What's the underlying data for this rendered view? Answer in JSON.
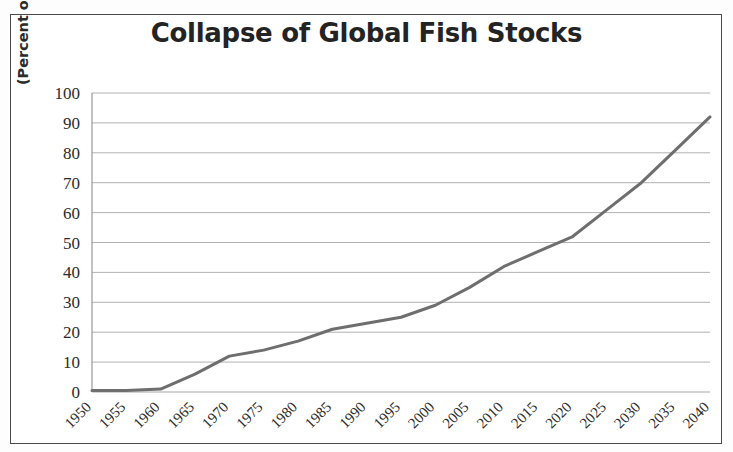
{
  "figure": {
    "title": "Collapse of Global Fish Stocks",
    "ylabel": "(Percent of Species Collapsed)",
    "border_color": "#4a4a4a",
    "background": "#ffffff"
  },
  "chart_data": {
    "type": "line",
    "title": "Collapse of Global Fish Stocks",
    "xlabel": "",
    "ylabel": "(Percent of Species Collapsed)",
    "categories": [
      "1950",
      "1955",
      "1960",
      "1965",
      "1970",
      "1975",
      "1980",
      "1985",
      "1990",
      "1995",
      "2000",
      "2005",
      "2010",
      "2015",
      "2020",
      "2025",
      "2030",
      "2035",
      "2040"
    ],
    "values": [
      0.5,
      0.5,
      1,
      6,
      12,
      14,
      17,
      21,
      23,
      25,
      29,
      35,
      42,
      47,
      52,
      61,
      70,
      81,
      92
    ],
    "series": [
      {
        "name": "Percent of Species Collapsed",
        "color": "#6e6e6e",
        "values": [
          0.5,
          0.5,
          1,
          6,
          12,
          14,
          17,
          21,
          23,
          25,
          29,
          35,
          42,
          47,
          52,
          61,
          70,
          81,
          92
        ]
      }
    ],
    "ylim": [
      0,
      100
    ],
    "yticks": [
      0,
      10,
      20,
      30,
      40,
      50,
      60,
      70,
      80,
      90,
      100
    ],
    "ytick_labels": [
      "0",
      "10",
      "20",
      "30",
      "40",
      "50",
      "60",
      "70",
      "80",
      "90",
      "100"
    ],
    "grid": true,
    "grid_color": "#a8a8a8",
    "legend": false,
    "legend_position": "none",
    "line_width": 3,
    "line_color": "#6e6e6e",
    "xtick_rotation": -45
  }
}
